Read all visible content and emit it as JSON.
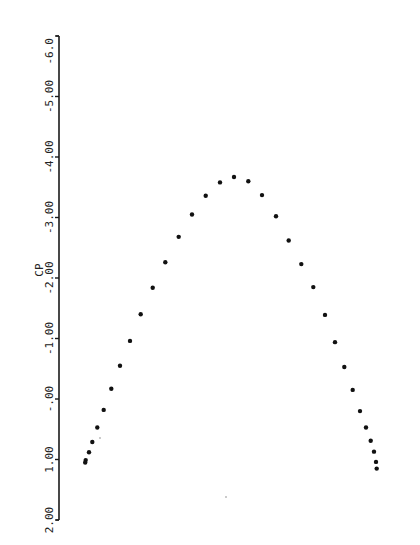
{
  "chart_data": {
    "type": "scatter",
    "title": "",
    "orientation": "rotated 90 degrees (CP axis drawn vertically on the left, labels rotated)",
    "ylabel": "CP",
    "xlabel": "",
    "ylim": [
      2.0,
      -6.0
    ],
    "y_inverted": true,
    "y_ticks": [
      -6.0,
      -5.0,
      -4.0,
      -3.0,
      -2.0,
      -1.0,
      0.0,
      1.0,
      2.0
    ],
    "y_tick_labels": [
      "-6.0",
      "-5.00",
      "-4.00",
      "-3.00",
      "-2.00",
      "-1.00",
      "-.00",
      "1.00",
      "2.00"
    ],
    "grid": false,
    "legend": null,
    "series": [
      {
        "name": "CP distribution",
        "marker": "dot",
        "x_pos": [
          0.0,
          0.011,
          0.022,
          0.035,
          0.06,
          0.08,
          0.115,
          0.156,
          0.198,
          0.236,
          0.284,
          0.333,
          0.385,
          0.432,
          0.482,
          0.53,
          0.578,
          0.627,
          0.672,
          0.72,
          0.77,
          0.815,
          0.853,
          0.893,
          0.932,
          0.966,
          0.995,
          1.024,
          1.046,
          1.064,
          1.08,
          1.091,
          1.098,
          1.101
        ],
        "values": [
          1.01,
          0.88,
          0.71,
          0.47,
          0.18,
          -0.17,
          -0.55,
          -0.96,
          -1.4,
          -1.84,
          -2.26,
          -2.68,
          -3.05,
          -3.36,
          -3.58,
          -3.67,
          -3.6,
          -3.37,
          -3.02,
          -2.62,
          -2.23,
          -1.85,
          -1.39,
          -0.94,
          -0.53,
          -0.15,
          0.2,
          0.47,
          0.69,
          0.87,
          1.04,
          1.15,
          null,
          null
        ]
      }
    ],
    "points_px": [
      [
        85.7,
        460
      ],
      [
        89,
        452
      ],
      [
        92.3,
        441.7
      ],
      [
        97.3,
        427.3
      ],
      [
        103.7,
        409.7
      ],
      [
        111.3,
        389
      ],
      [
        120,
        365.7
      ],
      [
        130,
        340.7
      ],
      [
        140.7,
        314.3
      ],
      [
        152.7,
        287.7
      ],
      [
        165.3,
        262
      ],
      [
        178.7,
        237
      ],
      [
        192,
        214.7
      ],
      [
        205.7,
        196
      ],
      [
        220,
        182.7
      ],
      [
        234,
        177
      ],
      [
        248.3,
        181.3
      ],
      [
        262,
        195
      ],
      [
        276,
        216
      ],
      [
        288.7,
        240.7
      ],
      [
        301.3,
        264.3
      ],
      [
        313.3,
        287.3
      ],
      [
        325,
        314.7
      ],
      [
        335,
        342
      ],
      [
        344.3,
        367
      ],
      [
        352.7,
        390
      ],
      [
        360,
        411
      ],
      [
        366,
        427.7
      ],
      [
        370.7,
        441
      ],
      [
        374,
        451.7
      ],
      [
        376,
        462
      ],
      [
        376.7,
        468.7
      ]
    ],
    "cp_values": [
      1.01,
      0.88,
      0.71,
      0.47,
      0.18,
      -0.17,
      -0.55,
      -0.96,
      -1.4,
      -1.84,
      -2.26,
      -2.68,
      -3.05,
      -3.36,
      -3.58,
      -3.67,
      -3.6,
      -3.37,
      -3.02,
      -2.62,
      -2.23,
      -1.85,
      -1.39,
      -0.94,
      -0.53,
      -0.15,
      0.2,
      0.47,
      0.69,
      0.87,
      1.04,
      1.15
    ]
  },
  "axis": {
    "title": "CP",
    "x_px": 59,
    "top_px": 36,
    "bottom_px": 520,
    "tick_labels": [
      "-6.0",
      "-5.00",
      "-4.00",
      "-3.00",
      "-2.00",
      "-1.00",
      "-.00",
      "1.00",
      "2.00"
    ]
  }
}
